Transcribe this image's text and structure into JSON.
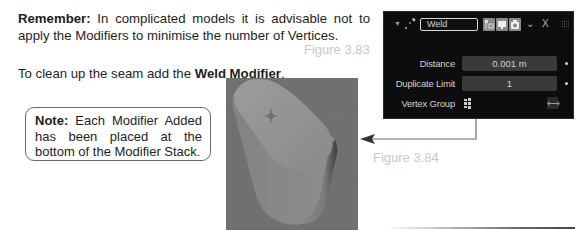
{
  "text": {
    "remember_label": "Remember:",
    "remember_body": " In complicated models it is advisable not to apply the Modifiers to minimise the number of Vertices.",
    "weld_intro": "To clean up the seam add the ",
    "weld_bold": "Weld Modifier",
    "weld_end": "."
  },
  "note": {
    "label": "Note:",
    "body": " Each Modifier Added has been placed at the bottom of the Modifier Stack."
  },
  "figures": {
    "fig_a": "Figure 3.83",
    "fig_b": "Figure 3.84"
  },
  "modifier_panel": {
    "name": "Weld",
    "icons": {
      "collapse": "triangle-down-icon",
      "modifier": "weld-modifier-icon",
      "edit_mode": "edit-mode-toggle-icon",
      "viewport": "viewport-display-toggle-icon",
      "render": "render-toggle-icon",
      "menu": "chevron-down-icon",
      "delete": "close-icon",
      "drag": "drag-handle-icon"
    },
    "menu_glyph": "⌄",
    "delete_glyph": "X",
    "fields": [
      {
        "label": "Distance",
        "value": "0.001 m"
      },
      {
        "label": "Duplicate Limit",
        "value": "1"
      }
    ],
    "vertex_group": {
      "label": "Vertex Group",
      "value": "",
      "invert_glyph": "⟷"
    }
  },
  "colors": {
    "panel_bg": "#0d0d0d",
    "field_bg": "#3a3a3a",
    "viewport_bg": "#707070",
    "figure_label": "#c9c9c9"
  }
}
